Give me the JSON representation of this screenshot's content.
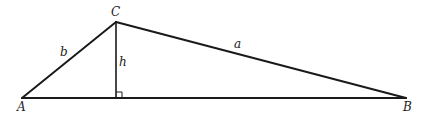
{
  "diagram": {
    "type": "triangle-with-altitude",
    "vertices": {
      "A": {
        "label": "A",
        "x": 22,
        "y": 98
      },
      "B": {
        "label": "B",
        "x": 406,
        "y": 98
      },
      "C": {
        "label": "C",
        "x": 116,
        "y": 22
      }
    },
    "altitude_foot": {
      "x": 116,
      "y": 98
    },
    "sides": {
      "a": {
        "label": "a",
        "from": "C",
        "to": "B"
      },
      "b": {
        "label": "b",
        "from": "A",
        "to": "C"
      },
      "c": {
        "label": "",
        "from": "A",
        "to": "B"
      }
    },
    "altitude": {
      "label": "h",
      "from": "C",
      "to": "foot"
    },
    "right_angle_marker": true,
    "stroke_color": "#1a1a1a",
    "background": "#ffffff"
  }
}
